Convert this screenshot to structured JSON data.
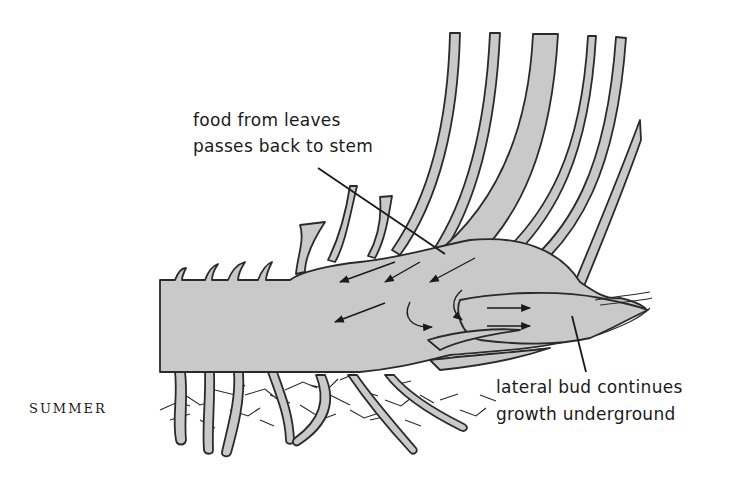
{
  "diagram": {
    "season_label": "SUMMER",
    "labels": {
      "food_flow_line1": "food from leaves",
      "food_flow_line2": "passes back to stem",
      "bud_line1": "lateral bud continues",
      "bud_line2": "growth underground"
    },
    "parts": [
      "rhizome stem",
      "leaves",
      "roots",
      "lateral bud",
      "food flow arrows"
    ],
    "colors": {
      "tissue_fill": "#c9c9c9",
      "outline": "#2a2a2a",
      "background": "#ffffff"
    }
  }
}
